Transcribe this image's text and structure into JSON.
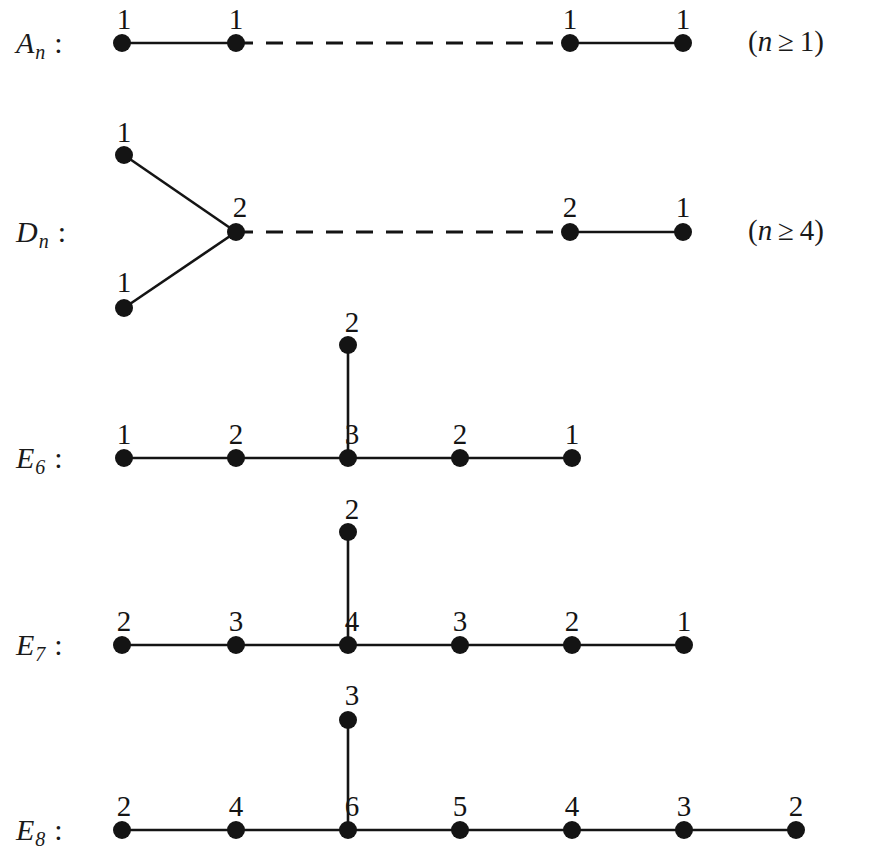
{
  "figure": {
    "kind": "dynkin-diagrams-with-marks",
    "background_color": "#ffffff",
    "ink_color": "#141414",
    "rows": [
      {
        "id": "A",
        "label_base": "A",
        "label_sub": "n",
        "colon": ":",
        "condition": "(n ≥ 1)",
        "condition_prefix": "(",
        "condition_var": "n",
        "condition_rel": "≥",
        "condition_value": "1",
        "condition_suffix": ")",
        "marks": [
          "1",
          "1",
          "1",
          "1"
        ],
        "has_dashed_gap": true,
        "node_count_visible": 4
      },
      {
        "id": "D",
        "label_base": "D",
        "label_sub": "n",
        "colon": ":",
        "condition": "(n ≥ 4)",
        "condition_prefix": "(",
        "condition_var": "n",
        "condition_rel": "≥",
        "condition_value": "4",
        "condition_suffix": ")",
        "marks": [
          "1",
          "1",
          "2",
          "2",
          "1"
        ],
        "fork_top_mark": "1",
        "fork_bottom_mark": "1",
        "junction_mark": "2",
        "tail_marks": [
          "2",
          "1"
        ],
        "has_dashed_gap": true,
        "node_count_visible": 5
      },
      {
        "id": "E6",
        "label_base": "E",
        "label_sub": "6",
        "colon": ":",
        "condition": "",
        "chain_marks": [
          "1",
          "2",
          "3",
          "2",
          "1"
        ],
        "branch_mark": "2",
        "branch_at_index": 2,
        "has_dashed_gap": false,
        "node_count_visible": 6
      },
      {
        "id": "E7",
        "label_base": "E",
        "label_sub": "7",
        "colon": ":",
        "condition": "",
        "chain_marks": [
          "2",
          "3",
          "4",
          "3",
          "2",
          "1"
        ],
        "branch_mark": "2",
        "branch_at_index": 2,
        "has_dashed_gap": false,
        "node_count_visible": 7
      },
      {
        "id": "E8",
        "label_base": "E",
        "label_sub": "8",
        "colon": ":",
        "condition": "",
        "chain_marks": [
          "2",
          "4",
          "6",
          "5",
          "4",
          "3",
          "2"
        ],
        "branch_mark": "3",
        "branch_at_index": 2,
        "has_dashed_gap": false,
        "node_count_visible": 8
      }
    ]
  }
}
